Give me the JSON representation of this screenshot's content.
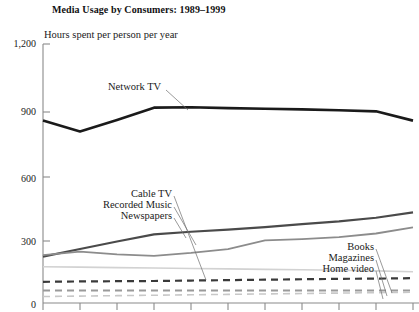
{
  "chart_data": {
    "type": "line",
    "title": "Media Usage by Consumers: 1989–1999",
    "subtitle": "Hours spent per person per year",
    "xlabel": "",
    "ylabel": "Hours spent per person per year",
    "ylim": [
      0,
      1200
    ],
    "yticks": [
      0,
      300,
      600,
      900,
      1200
    ],
    "ytick_labels": [
      "0",
      "300",
      "600",
      "900",
      "1,200"
    ],
    "grid": false,
    "legend_position": "inline-labels",
    "x": [
      1989,
      1990,
      1991,
      1992,
      1993,
      1994,
      1995,
      1996,
      1997,
      1998,
      1999
    ],
    "xtick_labels": [
      "",
      "",
      "",
      "",
      "",
      "",
      "",
      "",
      "",
      "",
      ""
    ],
    "series": [
      {
        "name": "Network TV",
        "color": "#1a1a1a",
        "width": 2.6,
        "dash": "none",
        "values": [
          845,
          795,
          848,
          905,
          907,
          903,
          900,
          897,
          893,
          888,
          845
        ]
      },
      {
        "name": "Cable TV",
        "color": "#4a4a4a",
        "width": 2.2,
        "dash": "none",
        "values": [
          215,
          250,
          285,
          318,
          330,
          340,
          352,
          365,
          378,
          395,
          420
        ]
      },
      {
        "name": "Recorded Music",
        "color": "#8c8c8c",
        "width": 1.8,
        "dash": "none",
        "values": [
          222,
          238,
          225,
          218,
          232,
          250,
          290,
          296,
          305,
          322,
          350
        ]
      },
      {
        "name": "Newspapers",
        "color": "#d2d2d2",
        "width": 1.6,
        "dash": "none",
        "values": [
          168,
          166,
          164,
          162,
          160,
          158,
          156,
          154,
          152,
          149,
          145
        ]
      },
      {
        "name": "Books",
        "color": "#3a3a3a",
        "width": 2.2,
        "dash": "dashed",
        "values": [
          98,
          100,
          101,
          102,
          104,
          106,
          108,
          110,
          112,
          113,
          115
        ]
      },
      {
        "name": "Magazines",
        "color": "#9a9a9a",
        "width": 2.0,
        "dash": "dashed",
        "values": [
          58,
          58,
          58,
          58,
          58,
          58,
          58,
          58,
          58,
          58,
          58
        ]
      },
      {
        "name": "Home video",
        "color": "#c8c8c8",
        "width": 1.6,
        "dash": "dashed",
        "values": [
          30,
          32,
          34,
          36,
          38,
          40,
          42,
          44,
          46,
          48,
          50
        ]
      }
    ],
    "annotations": [
      {
        "text": "Network TV",
        "align": "left"
      },
      {
        "text": "Cable TV",
        "align": "right"
      },
      {
        "text": "Recorded Music",
        "align": "right"
      },
      {
        "text": "Newspapers",
        "align": "right"
      },
      {
        "text": "Books",
        "align": "right"
      },
      {
        "text": "Magazines",
        "align": "right"
      },
      {
        "text": "Home video",
        "align": "right"
      }
    ]
  },
  "axis": {
    "y_labels": [
      "1,200",
      "900",
      "600",
      "300",
      "0"
    ]
  },
  "labels": {
    "network_tv": "Network TV",
    "cable_tv": "Cable TV",
    "recorded_music": "Recorded Music",
    "newspapers": "Newspapers",
    "books": "Books",
    "magazines": "Magazines",
    "home_video": "Home video"
  }
}
